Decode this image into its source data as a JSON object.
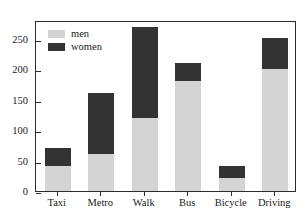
{
  "chart_data": {
    "type": "bar",
    "stacked": true,
    "title": "",
    "xlabel": "",
    "ylabel": "",
    "categories": [
      "Taxi",
      "Metro",
      "Walk",
      "Bus",
      "Bicycle",
      "Driving"
    ],
    "series": [
      {
        "name": "men",
        "color": "#d4d4d4",
        "values": [
          41,
          61,
          120,
          181,
          21,
          200
        ]
      },
      {
        "name": "women",
        "color": "#333333",
        "values": [
          29,
          100,
          150,
          30,
          20,
          51
        ]
      }
    ],
    "totals": [
      70,
      161,
      270,
      211,
      41,
      251
    ],
    "ylim": [
      0,
      281
    ],
    "yticks": [
      0,
      50,
      100,
      150,
      200,
      250
    ],
    "ytick_labels": [
      "0",
      "50",
      "100",
      "150",
      "200",
      "250"
    ],
    "grid": false,
    "legend_position": "upper left",
    "legend_entries": [
      "men",
      "women"
    ]
  }
}
